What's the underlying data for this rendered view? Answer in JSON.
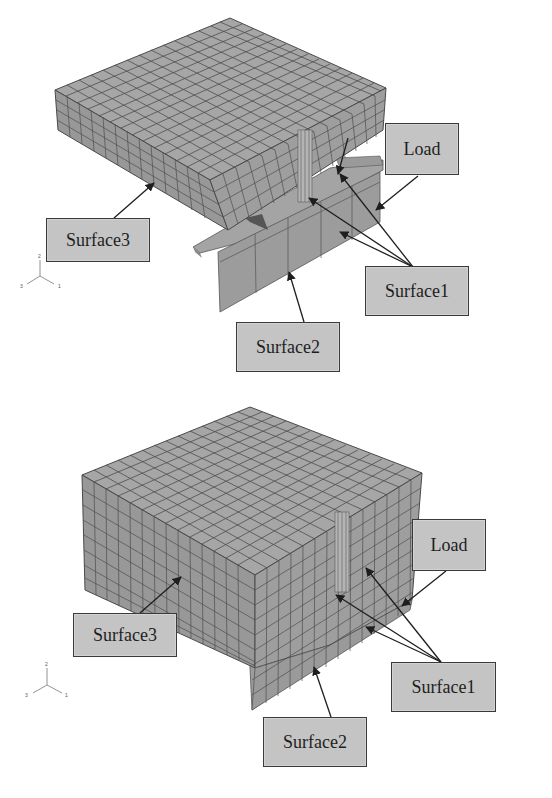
{
  "figure": {
    "panels": [
      {
        "id": "top",
        "description": "FE mesh of plate on angle bracket",
        "labels": {
          "load": "Load",
          "surface1": "Surface1",
          "surface2": "Surface2",
          "surface3": "Surface3"
        },
        "axis_triad": {
          "x": "1",
          "y": "2",
          "z": "3"
        }
      },
      {
        "id": "bottom",
        "description": "FE mesh of thick block on angle bracket",
        "labels": {
          "load": "Load",
          "surface1": "Surface1",
          "surface2": "Surface2",
          "surface3": "Surface3"
        },
        "axis_triad": {
          "x": "1",
          "y": "2",
          "z": "3"
        }
      }
    ],
    "colors": {
      "mesh_face": "#9a9a9a",
      "mesh_top": "#a8a8a8",
      "mesh_side_dark": "#8c8c8c",
      "mesh_lines": "#4a4a4a",
      "label_fill": "#c4c4c4",
      "label_border": "#3a3a3a",
      "arrow": "#2a2a2a",
      "background": "#ffffff"
    }
  }
}
